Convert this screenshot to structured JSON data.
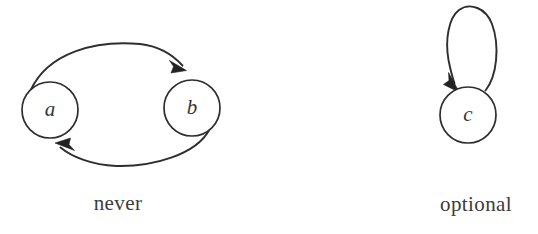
{
  "figure": {
    "background_color": "#ffffff",
    "stroke_color": "#2e2e2e",
    "text_color": "#3c3c3c",
    "panels": [
      {
        "id": "never",
        "caption": "never",
        "caption_x": 118,
        "caption_y": 205,
        "nodes": [
          {
            "id": "a",
            "label": "a",
            "cx": 50,
            "cy": 110,
            "r": 28
          },
          {
            "id": "b",
            "label": "b",
            "cx": 192,
            "cy": 108,
            "r": 28
          }
        ],
        "edges": [
          {
            "id": "a-to-b",
            "from": "a",
            "to": "b",
            "kind": "curve",
            "direction": "top"
          },
          {
            "id": "b-to-a",
            "from": "b",
            "to": "a",
            "kind": "curve",
            "direction": "bottom"
          }
        ]
      },
      {
        "id": "optional",
        "caption": "optional",
        "caption_x": 476,
        "caption_y": 206,
        "nodes": [
          {
            "id": "c",
            "label": "c",
            "cx": 468,
            "cy": 115,
            "r": 28
          }
        ],
        "edges": [
          {
            "id": "c-to-c",
            "from": "c",
            "to": "c",
            "kind": "self-loop",
            "direction": "up"
          }
        ]
      }
    ]
  }
}
